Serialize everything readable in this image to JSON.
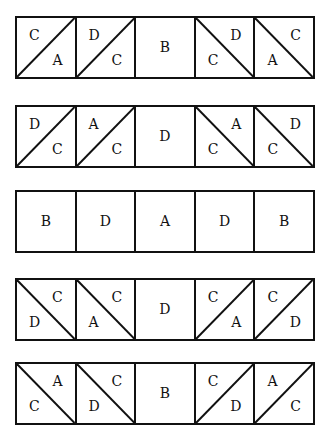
{
  "rows": [
    {
      "top": 16,
      "cells": [
        {
          "diag": "up",
          "a": "C",
          "b": "A"
        },
        {
          "diag": "up",
          "a": "D",
          "b": "C"
        },
        {
          "diag": "none",
          "a": "B"
        },
        {
          "diag": "down",
          "a": "D",
          "b": "C"
        },
        {
          "diag": "down",
          "a": "C",
          "b": "A"
        }
      ]
    },
    {
      "top": 105,
      "cells": [
        {
          "diag": "up",
          "a": "D",
          "b": "C"
        },
        {
          "diag": "up",
          "a": "A",
          "b": "C"
        },
        {
          "diag": "none",
          "a": "D"
        },
        {
          "diag": "down",
          "a": "A",
          "b": "C"
        },
        {
          "diag": "down",
          "a": "D",
          "b": "C"
        }
      ]
    },
    {
      "top": 190,
      "cells": [
        {
          "diag": "none",
          "a": "B"
        },
        {
          "diag": "none",
          "a": "D"
        },
        {
          "diag": "none",
          "a": "A"
        },
        {
          "diag": "none",
          "a": "D"
        },
        {
          "diag": "none",
          "a": "B"
        }
      ]
    },
    {
      "top": 278,
      "cells": [
        {
          "diag": "down",
          "a": "C",
          "b": "D"
        },
        {
          "diag": "down",
          "a": "C",
          "b": "A"
        },
        {
          "diag": "none",
          "a": "D"
        },
        {
          "diag": "up",
          "a": "C",
          "b": "A"
        },
        {
          "diag": "up",
          "a": "C",
          "b": "D"
        }
      ]
    },
    {
      "top": 362,
      "cells": [
        {
          "diag": "down",
          "a": "A",
          "b": "C"
        },
        {
          "diag": "down",
          "a": "C",
          "b": "D"
        },
        {
          "diag": "none",
          "a": "B"
        },
        {
          "diag": "up",
          "a": "C",
          "b": "D"
        },
        {
          "diag": "up",
          "a": "A",
          "b": "C"
        }
      ]
    }
  ]
}
